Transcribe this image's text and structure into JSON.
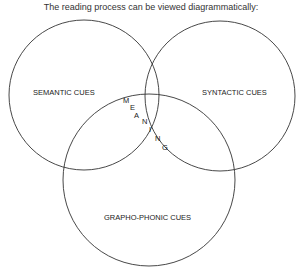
{
  "title": "The reading process can be viewed diagrammatically:",
  "circles": [
    {
      "label": "SEMANTIC CUES"
    },
    {
      "label": "SYNTACTIC CUES"
    },
    {
      "label": "GRAPHO-PHONIC CUES"
    }
  ],
  "center_label": [
    "M",
    "E",
    "A",
    "N",
    "I",
    "N",
    "G"
  ],
  "colors": {
    "stroke": "#333333",
    "text": "#222222"
  }
}
